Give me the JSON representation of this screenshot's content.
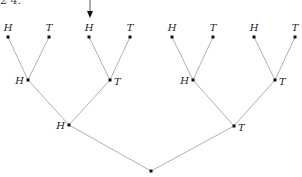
{
  "fragment_text": "2 4.",
  "diagram": {
    "type": "binary-tree",
    "edge_color": "#b0b0b0",
    "node_color": "#111111",
    "nodes": [
      {
        "id": "root",
        "label": "",
        "x": 151,
        "y": 171
      },
      {
        "id": "L1H",
        "label": "H",
        "x": 69,
        "y": 125,
        "label_side": "left"
      },
      {
        "id": "L1T",
        "label": "T",
        "x": 234,
        "y": 126,
        "label_side": "right"
      },
      {
        "id": "L2HH",
        "label": "H",
        "x": 28,
        "y": 80,
        "label_side": "left"
      },
      {
        "id": "L2HT",
        "label": "T",
        "x": 110,
        "y": 80,
        "label_side": "right"
      },
      {
        "id": "L2TH",
        "label": "H",
        "x": 193,
        "y": 80,
        "label_side": "left"
      },
      {
        "id": "L2TT",
        "label": "T",
        "x": 275,
        "y": 80,
        "label_side": "right"
      },
      {
        "id": "L3HHH",
        "label": "H",
        "x": 8,
        "y": 37,
        "label_side": "top"
      },
      {
        "id": "L3HHT",
        "label": "T",
        "x": 49,
        "y": 37,
        "label_side": "top"
      },
      {
        "id": "L3HTH",
        "label": "H",
        "x": 89,
        "y": 37,
        "label_side": "top"
      },
      {
        "id": "L3HTT",
        "label": "T",
        "x": 130,
        "y": 37,
        "label_side": "top"
      },
      {
        "id": "L3THH",
        "label": "H",
        "x": 172,
        "y": 37,
        "label_side": "top"
      },
      {
        "id": "L3THT",
        "label": "T",
        "x": 213,
        "y": 37,
        "label_side": "top"
      },
      {
        "id": "L3TTH",
        "label": "H",
        "x": 254,
        "y": 37,
        "label_side": "top"
      },
      {
        "id": "L3TTT",
        "label": "T",
        "x": 295,
        "y": 37,
        "label_side": "top"
      }
    ],
    "edges": [
      [
        "root",
        "L1H"
      ],
      [
        "root",
        "L1T"
      ],
      [
        "L1H",
        "L2HH"
      ],
      [
        "L1H",
        "L2HT"
      ],
      [
        "L1T",
        "L2TH"
      ],
      [
        "L1T",
        "L2TT"
      ],
      [
        "L2HH",
        "L3HHH"
      ],
      [
        "L2HH",
        "L3HHT"
      ],
      [
        "L2HT",
        "L3HTH"
      ],
      [
        "L2HT",
        "L3HTT"
      ],
      [
        "L2TH",
        "L3THH"
      ],
      [
        "L2TH",
        "L3THT"
      ],
      [
        "L2TT",
        "L3TTH"
      ],
      [
        "L2TT",
        "L3TTT"
      ]
    ],
    "arrow": {
      "target": "L3HTH",
      "x": 90,
      "y1": 0,
      "y2": 18
    }
  }
}
